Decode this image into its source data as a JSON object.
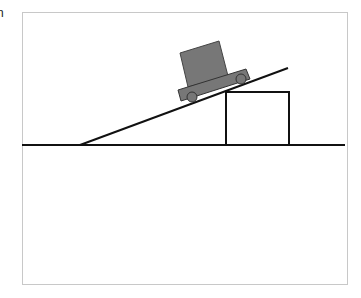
{
  "page": {
    "clipped_text": "n"
  },
  "diagram": {
    "colors": {
      "frame": "#c8c8c8",
      "line": "#111111",
      "cart_fill": "#777777",
      "cart_stroke": "#333333"
    }
  }
}
